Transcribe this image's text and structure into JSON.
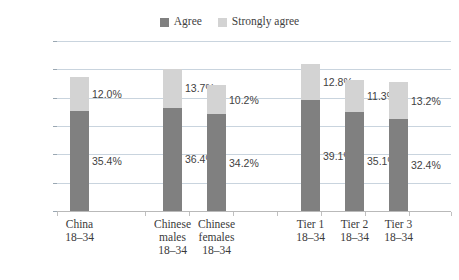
{
  "chart_data": {
    "type": "bar",
    "subtype": "stacked-bar",
    "title": "",
    "xlabel": "",
    "ylabel": "",
    "ylim": [
      0,
      60
    ],
    "ytick_labels": [
      "60.0%",
      "50.0%",
      "40.0%",
      "30.0%",
      "20.0%",
      "10.0%",
      "0.0%"
    ],
    "ytick_values": [
      60,
      50,
      40,
      30,
      20,
      10,
      0
    ],
    "grid": true,
    "legend_position": "top-center",
    "categories": [
      "China\n18–34",
      "Chinese\nmales\n18–34",
      "Chinese\nfemales\n18–34",
      "Tier 1\n18–34",
      "Tier 2\n18–34",
      "Tier 3\n18–34"
    ],
    "category_lines": [
      [
        "China",
        "18–34"
      ],
      [
        "Chinese",
        "males",
        "18–34"
      ],
      [
        "Chinese",
        "females",
        "18–34"
      ],
      [
        "Tier 1",
        "18–34"
      ],
      [
        "Tier 2",
        "18–34"
      ],
      [
        "Tier 3",
        "18–34"
      ]
    ],
    "series": [
      {
        "name": "Agree",
        "color": "#808080",
        "values": [
          35.4,
          36.4,
          34.2,
          39.1,
          35.1,
          32.4
        ],
        "labels": [
          "35.4%",
          "36.4%",
          "34.2%",
          "39.1%",
          "35.1%",
          "32.4%"
        ]
      },
      {
        "name": "Strongly agree",
        "color": "#d3d3d3",
        "values": [
          12.0,
          13.7,
          10.2,
          12.8,
          11.3,
          13.2
        ],
        "labels": [
          "12.0%",
          "13.7%",
          "10.2%",
          "12.8%",
          "11.3%",
          "13.2%"
        ]
      }
    ],
    "totals": [
      47.4,
      50.1,
      44.4,
      51.9,
      46.4,
      45.6
    ]
  },
  "legend": {
    "entries": [
      {
        "label": "Agree",
        "color": "#808080"
      },
      {
        "label": "Strongly agree",
        "color": "#d3d3d3"
      }
    ]
  },
  "colors": {
    "agree": "#808080",
    "strongly_agree": "#d3d3d3",
    "gridline": "#c9d4de",
    "axis": "#b9b9b9",
    "text": "#3a3a3a",
    "background": "#ffffff"
  }
}
